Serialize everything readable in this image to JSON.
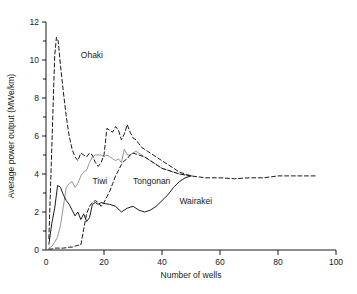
{
  "chart_data": {
    "type": "line",
    "title": "",
    "xlabel": "Number of wells",
    "ylabel": "Average power output (MWe/km)",
    "xlim": [
      0,
      100
    ],
    "ylim": [
      0,
      12
    ],
    "xticks": [
      0,
      20,
      40,
      60,
      80,
      100
    ],
    "yticks": [
      0,
      2,
      4,
      6,
      8,
      10,
      12
    ],
    "yminorticks": [
      1,
      3,
      5,
      7,
      9,
      11
    ],
    "grid": false,
    "legend": "inline-annotations",
    "series": [
      {
        "name": "Ohaki",
        "style": "dashed",
        "color": "#1a1a1a",
        "label_x": 12,
        "label_y": 10.1,
        "x": [
          1,
          2,
          3,
          3.6,
          4.2,
          5,
          6,
          7,
          8,
          9,
          10,
          11,
          12,
          13,
          14,
          15,
          16,
          17,
          18,
          19,
          20,
          21,
          22,
          23,
          24,
          25,
          26,
          27,
          28,
          29,
          30,
          31,
          32,
          33,
          34,
          35,
          36,
          37,
          38,
          39,
          40,
          42,
          44,
          46,
          48,
          50,
          55,
          60,
          65,
          70,
          75,
          80,
          85,
          90,
          93
        ],
        "y": [
          0.6,
          5.4,
          10.2,
          11.2,
          11.0,
          9.7,
          8.3,
          7.0,
          6.0,
          5.3,
          4.9,
          4.7,
          5.1,
          5.0,
          4.9,
          5.1,
          5.0,
          4.6,
          4.4,
          4.6,
          5.0,
          6.4,
          6.3,
          6.2,
          6.5,
          6.3,
          5.8,
          6.1,
          6.6,
          6.2,
          5.9,
          5.8,
          5.6,
          5.4,
          5.3,
          5.2,
          5.1,
          5.0,
          4.9,
          4.8,
          4.7,
          4.5,
          4.3,
          4.1,
          4.0,
          3.9,
          3.8,
          3.8,
          3.75,
          3.8,
          3.8,
          3.9,
          3.9,
          3.9,
          3.9
        ]
      },
      {
        "name": "Tiwi",
        "style": "solid-gray",
        "color": "#8a8a8a",
        "label_x": 16,
        "label_y": 3.5,
        "x": [
          1,
          2,
          3,
          4,
          5,
          6,
          7,
          8,
          9,
          10,
          11,
          12,
          13,
          14,
          15,
          16,
          17,
          18,
          19,
          20,
          21,
          22,
          23,
          24,
          25,
          26,
          27,
          28,
          29,
          30,
          31,
          32,
          33,
          34,
          35,
          36,
          38,
          40,
          42,
          44,
          46,
          48,
          50
        ],
        "y": [
          0.1,
          0.2,
          0.4,
          0.7,
          1.3,
          2.3,
          3.3,
          3.5,
          3.6,
          3.3,
          3.5,
          3.9,
          4.1,
          4.2,
          4.6,
          4.9,
          5.0,
          5.0,
          5.0,
          4.9,
          5.0,
          4.9,
          4.8,
          4.7,
          4.8,
          4.6,
          5.3,
          5.0,
          5.0,
          5.1,
          5.2,
          5.1,
          5.0,
          4.9,
          4.8,
          4.7,
          4.5,
          4.3,
          4.2,
          4.1,
          4.0,
          3.95,
          3.9
        ]
      },
      {
        "name": "Tongonan",
        "style": "dashed",
        "color": "#1a1a1a",
        "label_x": 30,
        "label_y": 3.5,
        "x": [
          1,
          2,
          3,
          4,
          5,
          6,
          7,
          8,
          9,
          10,
          11,
          12,
          13,
          14,
          15,
          16,
          17,
          18,
          19,
          20,
          21,
          22,
          23,
          24,
          25,
          26,
          27,
          28,
          29,
          30,
          32,
          34,
          36,
          38,
          40,
          42,
          44,
          46,
          48,
          50
        ],
        "y": [
          0.05,
          0.05,
          0.1,
          0.1,
          0.1,
          0.1,
          0.12,
          0.15,
          0.15,
          0.2,
          0.25,
          0.25,
          1.1,
          1.9,
          2.3,
          2.5,
          2.6,
          2.5,
          2.3,
          2.5,
          2.8,
          3.1,
          3.5,
          3.9,
          4.2,
          4.5,
          4.7,
          4.8,
          5.0,
          5.1,
          5.0,
          4.9,
          4.7,
          4.5,
          4.3,
          4.2,
          4.1,
          4.0,
          3.95,
          3.9
        ]
      },
      {
        "name": "Wairakei",
        "style": "solid",
        "color": "#1a1a1a",
        "label_x": 46,
        "label_y": 2.4,
        "x": [
          1,
          2,
          3,
          4,
          5,
          6,
          7,
          8,
          9,
          10,
          11,
          12,
          13,
          14,
          15,
          16,
          17,
          18,
          19,
          20,
          22,
          24,
          26,
          28,
          30,
          32,
          34,
          36,
          38,
          40,
          42,
          44,
          46,
          48,
          50
        ],
        "y": [
          0.3,
          1.4,
          2.2,
          3.4,
          3.3,
          2.9,
          2.6,
          2.4,
          2.1,
          1.8,
          2.0,
          1.6,
          1.9,
          1.5,
          1.7,
          2.4,
          2.5,
          2.4,
          2.5,
          2.45,
          2.4,
          2.3,
          2.0,
          2.2,
          2.3,
          2.1,
          2.0,
          2.1,
          2.3,
          2.6,
          2.9,
          3.3,
          3.6,
          3.8,
          3.9
        ]
      }
    ]
  }
}
